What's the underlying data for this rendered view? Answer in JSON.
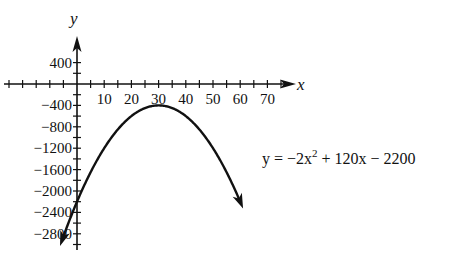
{
  "chart_data": {
    "type": "line",
    "title": "",
    "xlabel": "x",
    "ylabel": "y",
    "equation": "y = −2x² + 120x − 2200",
    "equation_parts": {
      "lhs": "y = −2x",
      "exp": "2",
      "rhs": " + 120x − 2200"
    },
    "x_ticks": [
      10,
      20,
      30,
      40,
      50,
      60,
      70
    ],
    "x_tick_labels": [
      "10",
      "20",
      "30",
      "40",
      "50",
      "60",
      "70"
    ],
    "y_ticks": [
      400,
      -400,
      -800,
      -1200,
      -1600,
      -2000,
      -2400,
      -2800
    ],
    "y_tick_labels": [
      "400",
      "−400",
      "−800",
      "−1200",
      "−1600",
      "−2000",
      "−2400",
      "−2800"
    ],
    "xlim": [
      -15,
      75
    ],
    "ylim": [
      -3000,
      600
    ],
    "vertex": {
      "x": 30,
      "y": -400
    },
    "series": [
      {
        "name": "y = −2x² + 120x − 2200",
        "x": [
          -1,
          0,
          5,
          10,
          15,
          20,
          25,
          30,
          35,
          40,
          45,
          50,
          55,
          58
        ],
        "values": [
          -2322,
          -2200,
          -1650,
          -1200,
          -850,
          -600,
          -450,
          -400,
          -450,
          -600,
          -850,
          -1200,
          -1650,
          -2008
        ]
      }
    ],
    "grid": false,
    "legend": "none"
  }
}
